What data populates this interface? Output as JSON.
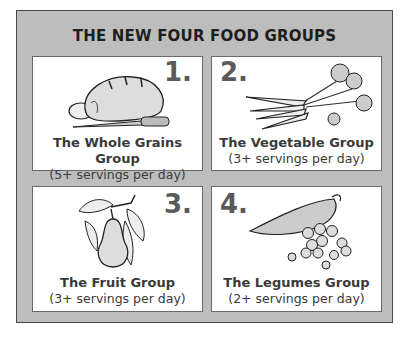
{
  "title": "THE NEW FOUR FOOD GROUPS",
  "groups": [
    {
      "number": "1.",
      "name": "The Whole Grains Group",
      "servings": "(5+ servings per day)",
      "illustration": "bread-loaf-and-knife"
    },
    {
      "number": "2.",
      "name": "The Vegetable Group",
      "servings": "(3+ servings per day)",
      "illustration": "bunch-of-carrots"
    },
    {
      "number": "3.",
      "name": "The Fruit Group",
      "servings": "(3+ servings per day)",
      "illustration": "pear-on-branch"
    },
    {
      "number": "4.",
      "name": "The Legumes Group",
      "servings": "(2+ servings per day)",
      "illustration": "pea-pod-and-peas"
    }
  ],
  "colors": {
    "frame": "#bdbdbd",
    "panel": "#ffffff",
    "text": "#3a3a3a",
    "number": "#5a5a5a"
  }
}
